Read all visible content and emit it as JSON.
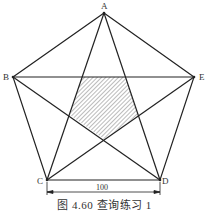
{
  "figure": {
    "caption": "图 4.60   查询练习 1",
    "dimension_label": "100",
    "points": {
      "A": {
        "label": "A",
        "x": 104,
        "y": 13
      },
      "B": {
        "label": "B",
        "x": 13,
        "y": 77
      },
      "E": {
        "label": "E",
        "x": 194,
        "y": 77
      },
      "C": {
        "label": "C",
        "x": 47,
        "y": 180
      },
      "D": {
        "label": "D",
        "x": 160,
        "y": 180
      }
    },
    "shaded_region": "inner pentagon (hatched)",
    "line_color": "#222222"
  }
}
